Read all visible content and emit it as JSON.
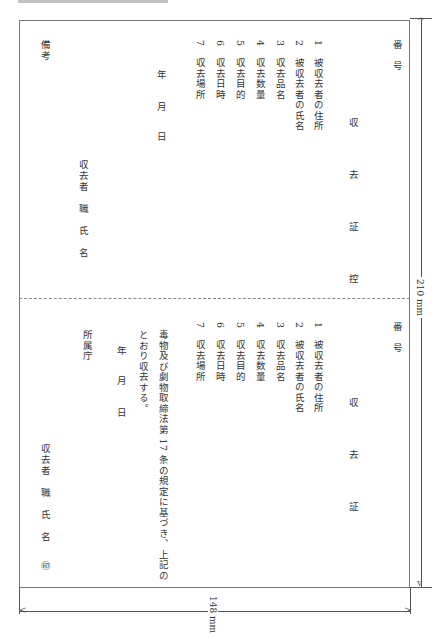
{
  "document": {
    "orientation": "rotated-90-clockwise",
    "header_text_cut": "",
    "stub": {
      "number_label": "番　号",
      "title": "収　去　証　控",
      "items": [
        {
          "no": "1",
          "label": "被収去者の住所"
        },
        {
          "no": "2",
          "label": "被収去者の氏名"
        },
        {
          "no": "3",
          "label": "収去品名"
        },
        {
          "no": "4",
          "label": "収去数量"
        },
        {
          "no": "5",
          "label": "収去目的"
        },
        {
          "no": "6",
          "label": "収去日時"
        },
        {
          "no": "7",
          "label": "収去場所"
        }
      ],
      "date": {
        "year": "年",
        "month": "月",
        "day": "日"
      },
      "collector": "収去者　職　氏　名",
      "remarks": "備考"
    },
    "certificate": {
      "number_label": "番　号",
      "title": "収　去　証",
      "items": [
        {
          "no": "1",
          "label": "被収去者の住所"
        },
        {
          "no": "2",
          "label": "被収去者の氏名"
        },
        {
          "no": "3",
          "label": "収去品名"
        },
        {
          "no": "4",
          "label": "収去数量"
        },
        {
          "no": "5",
          "label": "収去目的"
        },
        {
          "no": "6",
          "label": "収去日時"
        },
        {
          "no": "7",
          "label": "収去場所"
        }
      ],
      "statement_line1": "毒物及び劇物取締法第 17 条の規定に基づき、上記の",
      "statement_line2": "とおり収去する。",
      "date": {
        "year": "年",
        "month": "月",
        "day": "日"
      },
      "agency": "所属庁",
      "collector": "収去者　職　氏　名",
      "seal": "㊞"
    },
    "dimensions": {
      "height_label": "210 mm",
      "width_label": "148 mm"
    }
  }
}
